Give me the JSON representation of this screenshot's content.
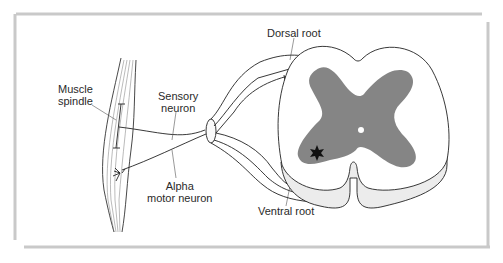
{
  "figure": {
    "type": "anatomical-diagram",
    "colors": {
      "frame": "#c8c8c8",
      "gray_matter": "#858585",
      "ventral_shading": "#ececec",
      "line": "#222222"
    }
  },
  "labels": {
    "muscle_spindle_1": "Muscle",
    "muscle_spindle_2": "spindle",
    "sensory_neuron_1": "Sensory",
    "sensory_neuron_2": "neuron",
    "alpha_motor_1": "Alpha",
    "alpha_motor_2": "motor neuron",
    "dorsal_root": "Dorsal root",
    "ventral_root": "Ventral root"
  }
}
